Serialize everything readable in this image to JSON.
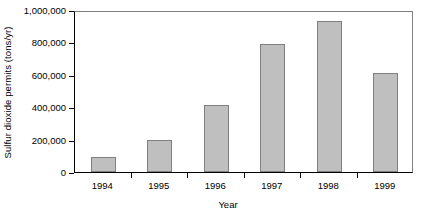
{
  "chart_data": {
    "type": "bar",
    "title": "",
    "xlabel": "Year",
    "ylabel": "Sulfur dioxide permits (tons/yr)",
    "categories": [
      "1994",
      "1995",
      "1996",
      "1997",
      "1998",
      "1999"
    ],
    "values": [
      95000,
      195000,
      415000,
      790000,
      930000,
      610000
    ],
    "ylim": [
      0,
      1000000
    ],
    "yticks": [
      0,
      200000,
      400000,
      600000,
      800000,
      1000000
    ],
    "ytick_labels": [
      "0",
      "200,000",
      "400,000",
      "600,000",
      "800,000",
      "1,000,000"
    ],
    "grid": false,
    "legend": null,
    "series": [
      {
        "name": "Sulfur dioxide permits",
        "values": [
          95000,
          195000,
          415000,
          790000,
          930000,
          610000
        ]
      }
    ],
    "colors": {
      "bar_fill": "#bfbfbf",
      "bar_border": "#7f7f7f",
      "axis": "#000000",
      "frame": "#808080",
      "background": "#ffffff"
    }
  }
}
